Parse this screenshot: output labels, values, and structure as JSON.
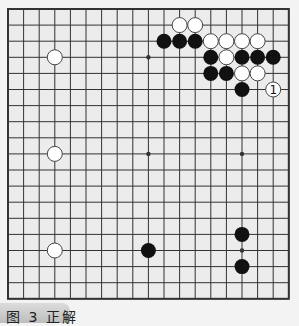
{
  "diagram": {
    "type": "go-board",
    "size": 19,
    "colors": {
      "background": "#ececec",
      "line": "#333333",
      "black": "#111111",
      "white": "#ffffff",
      "outside": "#f3f3f3"
    },
    "star_points": [
      [
        3,
        3
      ],
      [
        9,
        3
      ],
      [
        15,
        3
      ],
      [
        3,
        9
      ],
      [
        9,
        9
      ],
      [
        15,
        9
      ],
      [
        3,
        15
      ],
      [
        9,
        15
      ],
      [
        15,
        15
      ]
    ],
    "black_stones": [
      [
        10,
        2
      ],
      [
        11,
        2
      ],
      [
        12,
        2
      ],
      [
        13,
        3
      ],
      [
        15,
        3
      ],
      [
        16,
        3
      ],
      [
        17,
        3
      ],
      [
        13,
        4
      ],
      [
        14,
        4
      ],
      [
        15,
        5
      ],
      [
        9,
        15
      ],
      [
        15,
        14
      ],
      [
        15,
        16
      ]
    ],
    "white_stones": [
      [
        11,
        1
      ],
      [
        12,
        1
      ],
      [
        13,
        2
      ],
      [
        14,
        2
      ],
      [
        15,
        2
      ],
      [
        16,
        2
      ],
      [
        14,
        3
      ],
      [
        15,
        4
      ],
      [
        16,
        4
      ],
      [
        3,
        3
      ],
      [
        3,
        9
      ],
      [
        3,
        15
      ]
    ],
    "numbered_stones": [
      {
        "col": 17,
        "row": 5,
        "color": "white",
        "label": "1"
      }
    ]
  },
  "caption": {
    "label": "图 3  正解"
  }
}
